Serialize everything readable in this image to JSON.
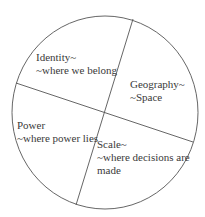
{
  "diagram": {
    "type": "circle-quadrants",
    "colors": {
      "outline": "#555555",
      "text": "#3a3a3a",
      "background": "#ffffff"
    },
    "sections": [
      {
        "id": "identity",
        "title": "Identity~",
        "subtitle": "~where we belong"
      },
      {
        "id": "geography",
        "title": "Geography~",
        "subtitle": "~Space"
      },
      {
        "id": "power",
        "title": "Power",
        "subtitle": "~where power lies"
      },
      {
        "id": "scale",
        "title": "Scale~",
        "subtitle": "~where decisions are",
        "subtitle_cont": "made"
      }
    ]
  }
}
